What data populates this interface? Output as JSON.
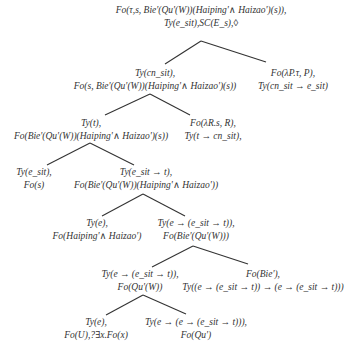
{
  "diagram": {
    "type": "semantic-tree",
    "nodes": [
      {
        "id": "root",
        "lines": [
          "Fo(τ,s, Bie'(Qu'(W))(Haiping'∧ Haizao')(s)),",
          "Ty(e_sit),SC(E_s),◊"
        ]
      },
      {
        "id": "n1",
        "lines": [
          "Ty(cn_sit),",
          "Fo(s, Bie'(Qu'(W))(Haiping'∧ Haizao')(s))"
        ]
      },
      {
        "id": "n2",
        "lines": [
          "Fo(λP.τ, P),",
          "Ty(cn_sit → e_sit)"
        ]
      },
      {
        "id": "n3",
        "lines": [
          "Ty(t),",
          "Fo(Bie'(Qu'(W))(Haiping'∧ Haizao')(s))"
        ]
      },
      {
        "id": "n4",
        "lines": [
          "Fo(λR.s, R),",
          "Ty(t → cn_sit),"
        ]
      },
      {
        "id": "n5",
        "lines": [
          "Ty(e_sit),",
          "Fo(s)"
        ]
      },
      {
        "id": "n6",
        "lines": [
          "Ty(e_sit → t),",
          "Fo(Bie'(Qu'(W))(Haiping'∧ Haizao'))"
        ]
      },
      {
        "id": "n7",
        "lines": [
          "Ty(e),",
          "Fo(Haiping'∧ Haizao')"
        ]
      },
      {
        "id": "n8",
        "lines": [
          "Ty(e → (e_sit → t)),",
          "Fo(Bie'(Qu'(W)))"
        ]
      },
      {
        "id": "n9",
        "lines": [
          "Ty(e → (e_sit → t)),",
          "Fo(Qu'(W))"
        ]
      },
      {
        "id": "n10",
        "lines": [
          "Fo(Bie'),",
          "Ty((e → (e_sit → t)) → (e → (e_sit → t)))"
        ]
      },
      {
        "id": "n11",
        "lines": [
          "Ty(e),",
          "Fo(U),?∃x.Fo(x)"
        ]
      },
      {
        "id": "n12",
        "lines": [
          "Ty(e → (e → (e_sit → t))),",
          "Fo(Qu')"
        ]
      }
    ],
    "edges": [
      [
        "root",
        "n1"
      ],
      [
        "root",
        "n2"
      ],
      [
        "n1",
        "n3"
      ],
      [
        "n1",
        "n4"
      ],
      [
        "n3",
        "n5"
      ],
      [
        "n3",
        "n6"
      ],
      [
        "n6",
        "n7"
      ],
      [
        "n6",
        "n8"
      ],
      [
        "n8",
        "n9"
      ],
      [
        "n8",
        "n10"
      ],
      [
        "n9",
        "n11"
      ],
      [
        "n9",
        "n12"
      ]
    ],
    "line_color": "#333333"
  }
}
